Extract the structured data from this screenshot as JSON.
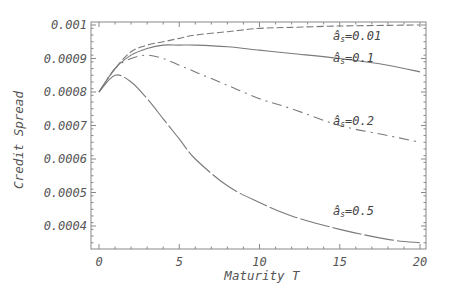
{
  "chart_data": {
    "type": "line",
    "title": "",
    "xlabel": "Maturity T",
    "ylabel": "Credit Spread",
    "xlim": [
      0,
      20
    ],
    "ylim": [
      0.00033,
      0.001
    ],
    "grid": false,
    "legend": "inline curve labels",
    "x_ticks": [
      "0",
      "5",
      "10",
      "15",
      "20"
    ],
    "y_ticks": [
      "0.0004",
      "0.0005",
      "0.0006",
      "0.0007",
      "0.0008",
      "0.0009",
      "0.001"
    ],
    "x": [
      0,
      1,
      2,
      3,
      4,
      5,
      6,
      8,
      10,
      12,
      15,
      18,
      20
    ],
    "series": [
      {
        "name": "σs=0.01",
        "label": "âs=0.01",
        "style": "dashed",
        "values": [
          0.0008,
          0.00087,
          0.00092,
          0.00094,
          0.00095,
          0.00096,
          0.00097,
          0.00098,
          0.00099,
          0.000993,
          0.000997,
          0.000999,
          0.001
        ]
      },
      {
        "name": "σs=0.1",
        "label": "âs=0.1",
        "style": "solid",
        "values": [
          0.0008,
          0.00087,
          0.00091,
          0.00093,
          0.00094,
          0.00094,
          0.00094,
          0.000935,
          0.000925,
          0.000915,
          0.0009,
          0.00088,
          0.00086
        ]
      },
      {
        "name": "σs=0.2",
        "label": "âs=0.2",
        "style": "dash-dot",
        "values": [
          0.0008,
          0.00087,
          0.0009,
          0.00091,
          0.0009,
          0.00088,
          0.00086,
          0.00082,
          0.00078,
          0.00075,
          0.0007,
          0.00067,
          0.00065
        ]
      },
      {
        "name": "σs=0.5",
        "label": "âs=0.5",
        "style": "long-dash",
        "values": [
          0.0008,
          0.00085,
          0.00083,
          0.00078,
          0.00072,
          0.00066,
          0.0006,
          0.00052,
          0.00047,
          0.00043,
          0.00039,
          0.00036,
          0.00035
        ]
      }
    ],
    "annotations": [
      {
        "text": "âs=0.01",
        "near": "σs=0.01 curve, T≈16"
      },
      {
        "text": "âs=0.1",
        "near": "σs=0.1 curve, T≈16"
      },
      {
        "text": "âs=0.2",
        "near": "σs=0.2 curve, T≈16"
      },
      {
        "text": "âs=0.5",
        "near": "σs=0.5 curve, T≈16"
      }
    ]
  },
  "labels": {
    "xlabel": "Maturity T",
    "ylabel": "Credit Spread",
    "curve_prefix": "â",
    "curve_sub": "s",
    "curve_values": [
      "=0.01",
      "=0.1",
      "=0.2",
      "=0.5"
    ]
  },
  "colors": {
    "frame": "#888888",
    "curve": "#7a7a7a",
    "text": "#555555"
  }
}
